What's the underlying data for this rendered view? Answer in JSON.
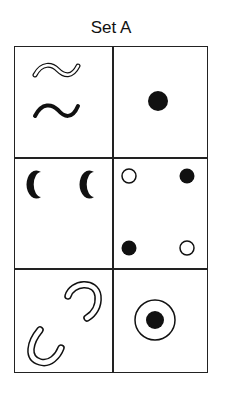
{
  "title": "Set A",
  "grid": {
    "rows": 3,
    "columns": 2,
    "cells": [
      {
        "row": 1,
        "col": 1,
        "content": "two wavy lines: outlined (top) and solid (bottom)"
      },
      {
        "row": 1,
        "col": 2,
        "content": "one solid black dot"
      },
      {
        "row": 2,
        "col": 1,
        "content": "two solid black crescents"
      },
      {
        "row": 2,
        "col": 2,
        "content": "four dots: open top-left, solid top-right, solid bottom-left, open bottom-right"
      },
      {
        "row": 3,
        "col": 1,
        "content": "two outlined U-shapes, rotated"
      },
      {
        "row": 3,
        "col": 2,
        "content": "solid dot inside open circle"
      }
    ]
  },
  "colors": {
    "ink": "#111111",
    "background": "#ffffff"
  }
}
